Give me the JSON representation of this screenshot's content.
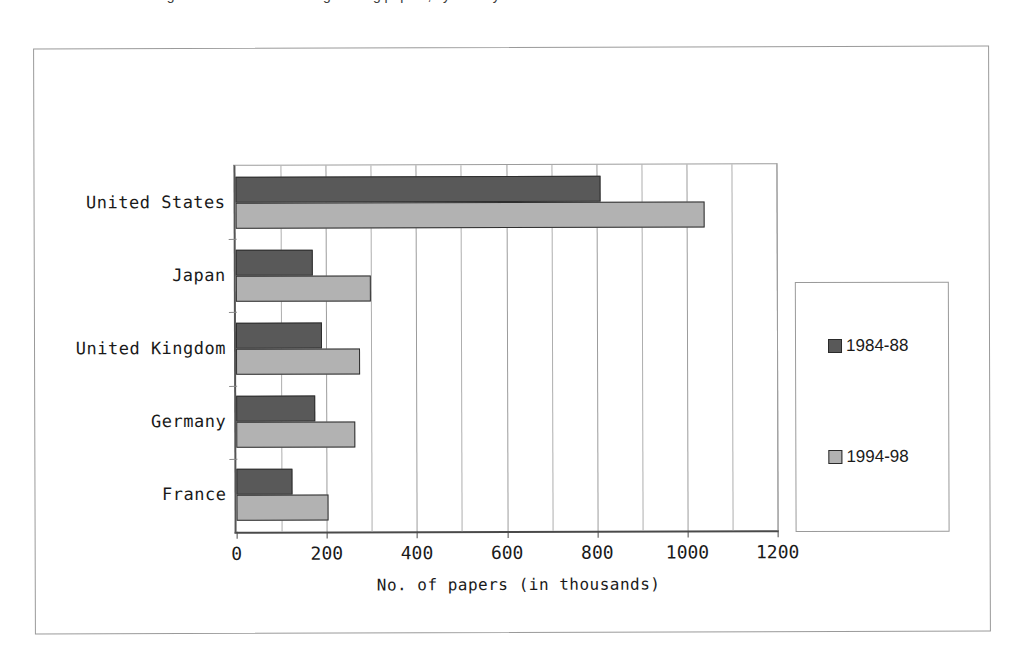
{
  "title": {
    "text": "Figure 3-5. Science and engineering papers, by country",
    "cropped": true
  },
  "chart_data": {
    "type": "bar",
    "orientation": "horizontal",
    "title": "",
    "xlabel": "No. of papers (in thousands)",
    "ylabel": "",
    "categories": [
      "United States",
      "Japan",
      "United Kingdom",
      "Germany",
      "France"
    ],
    "series": [
      {
        "name": "1984-88",
        "color": "#595959",
        "values": [
          810,
          170,
          190,
          175,
          125
        ]
      },
      {
        "name": "1994-98",
        "color": "#b2b2b2",
        "values": [
          1040,
          300,
          275,
          265,
          205
        ]
      }
    ],
    "xlim": [
      0,
      1200
    ],
    "xticks": [
      0,
      200,
      400,
      600,
      800,
      1000,
      1200
    ],
    "xtick_labels": [
      "0",
      "200",
      "400",
      "600",
      "800",
      "1000",
      "1200"
    ],
    "gridline_step": 100,
    "grid": true,
    "legend_position": "right",
    "legend_entries": [
      {
        "label": "1984-88",
        "color": "#595959"
      },
      {
        "label": "1994-98",
        "color": "#b2b2b2"
      }
    ]
  },
  "colors": {
    "series_1984_88": "#595959",
    "series_1994_98": "#b2b2b2",
    "frame": "#9a9a9a",
    "axis": "#4a4a4a",
    "gridline": "#aeaeae",
    "text": "#1a1a1a",
    "background": "#ffffff"
  }
}
